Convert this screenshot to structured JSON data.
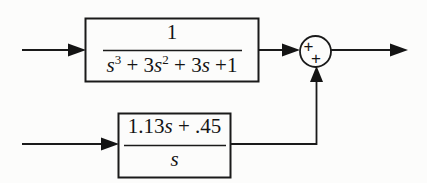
{
  "diagram": {
    "type": "control-system-block-diagram",
    "background_color": "#fcfcfb",
    "line_color": "#1a1a1a",
    "blocks": [
      {
        "id": "forward-plant",
        "label": "1 / (s^3 + 3s^2 + 3s +1)",
        "numerator": "1",
        "denominator_parts": [
          {
            "text": "s",
            "italic": true
          },
          {
            "text": "3",
            "superscript": true
          },
          {
            "text": " + 3",
            "italic": false
          },
          {
            "text": "s",
            "italic": true
          },
          {
            "text": "2",
            "superscript": true
          },
          {
            "text": " + 3",
            "italic": false
          },
          {
            "text": "s",
            "italic": true
          },
          {
            "text": " +1",
            "italic": false
          }
        ],
        "denominator_plain": "s3 + 3s2 + 3s +1",
        "rect": {
          "x": 85,
          "y": 18,
          "w": 174,
          "h": 64
        }
      },
      {
        "id": "feedforward-compensator",
        "label": "(1.13s + .45) / s",
        "numerator_parts": [
          {
            "text": "1.13",
            "italic": false
          },
          {
            "text": "s",
            "italic": true
          },
          {
            "text": " + .45",
            "italic": false
          }
        ],
        "numerator_plain": "1.13s + .45",
        "denominator_parts": [
          {
            "text": "s",
            "italic": true
          }
        ],
        "denominator_plain": "s",
        "rect": {
          "x": 118,
          "y": 113,
          "w": 113,
          "h": 65
        }
      }
    ],
    "summing_junction": {
      "id": "summer",
      "center": {
        "x": 315.5,
        "y": 51.5
      },
      "radius": 15.5,
      "signs": [
        {
          "label": "+",
          "position": "upper-left",
          "for_input": "forward-plant-output"
        },
        {
          "label": "+",
          "position": "lower-center",
          "for_input": "feedforward-output"
        }
      ]
    },
    "signals": [
      {
        "id": "input-top",
        "label": "",
        "from": {
          "x": 22,
          "y": 50
        },
        "to": {
          "x": 85,
          "y": 50
        },
        "arrow": true
      },
      {
        "id": "input-bottom",
        "label": "",
        "from": {
          "x": 22,
          "y": 144
        },
        "to": {
          "x": 118,
          "y": 144
        },
        "arrow": true
      },
      {
        "id": "plant-to-summer",
        "label": "",
        "from": {
          "x": 259,
          "y": 50
        },
        "to": {
          "x": 300,
          "y": 50
        },
        "arrow": true
      },
      {
        "id": "compensator-to-summer",
        "label": "",
        "from": {
          "x": 231,
          "y": 144
        },
        "to": {
          "x": 316,
          "y": 67
        },
        "arrow": true,
        "elbow": true
      },
      {
        "id": "output",
        "label": "",
        "from": {
          "x": 331,
          "y": 50
        },
        "to": {
          "x": 407,
          "y": 50
        },
        "arrow": true
      }
    ]
  }
}
